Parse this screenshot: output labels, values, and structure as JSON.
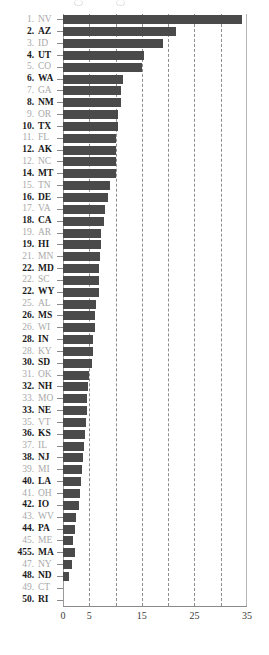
{
  "chart_data": {
    "type": "bar",
    "orientation": "horizontal",
    "title": "",
    "xlabel": "",
    "ylabel": "",
    "xlim": [
      0,
      35
    ],
    "grid": true,
    "gridlines": [
      0,
      5,
      10,
      15,
      20,
      25,
      30
    ],
    "xticks": [
      0,
      5,
      15,
      25,
      35
    ],
    "xtick_labels": [
      "0",
      "5",
      "15",
      "25",
      "35"
    ],
    "legend": null,
    "categories": [
      "NV",
      "AZ",
      "ID",
      "UT",
      "CO",
      "WA",
      "GA",
      "NM",
      "OR",
      "TX",
      "FL",
      "AK",
      "NC",
      "MT",
      "TN",
      "DE",
      "VA",
      "CA",
      "AR",
      "HI",
      "MN",
      "MD",
      "SC",
      "WY",
      "AL",
      "MS",
      "WI",
      "IN",
      "KY",
      "SD",
      "OK",
      "NH",
      "MO",
      "NE",
      "VT",
      "KS",
      "IL",
      "NJ",
      "MI",
      "LA",
      "OH",
      "IO",
      "WV",
      "PA",
      "ME",
      "MA",
      "NY",
      "ND",
      "CT",
      "RI"
    ],
    "values": [
      34.0,
      21.5,
      19.0,
      15.5,
      15.0,
      11.5,
      11.0,
      11.0,
      10.5,
      10.5,
      10.0,
      10.0,
      10.0,
      10.0,
      9.0,
      8.5,
      8.0,
      7.8,
      7.3,
      7.3,
      7.0,
      6.8,
      6.8,
      6.8,
      6.3,
      6.0,
      6.0,
      5.8,
      5.8,
      5.5,
      5.0,
      4.8,
      4.6,
      4.6,
      4.4,
      4.2,
      4.0,
      3.8,
      3.6,
      3.4,
      3.2,
      3.0,
      2.4,
      2.2,
      1.9,
      2.2,
      1.8,
      1.1,
      0.0,
      0.0
    ],
    "ranks": [
      "1.",
      "2.",
      "3.",
      "4.",
      "5.",
      "6.",
      "7.",
      "8.",
      "9.",
      "10.",
      "11.",
      "12.",
      "12.",
      "14.",
      "15.",
      "16.",
      "17.",
      "18.",
      "19.",
      "19.",
      "21.",
      "22.",
      "22.",
      "22.",
      "25.",
      "26.",
      "26.",
      "28.",
      "28.",
      "30.",
      "31.",
      "32.",
      "33.",
      "33.",
      "35.",
      "36.",
      "37.",
      "38.",
      "39.",
      "40.",
      "41.",
      "42.",
      "43.",
      "44.",
      "45.",
      "455.",
      "47.",
      "48.",
      "49.",
      "50."
    ],
    "colors": {
      "bar": "#4a4a4a",
      "gridline": "#7a7a7a",
      "axis": "#8a8a8a",
      "label_bold": "#1a1a1a",
      "label_dim": "#a9a9a9",
      "background": "#ffffff"
    }
  }
}
